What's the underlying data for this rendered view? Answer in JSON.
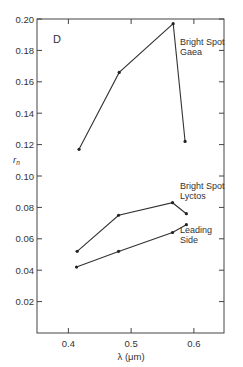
{
  "chart_data": {
    "type": "line",
    "title": "",
    "panel_label": "D",
    "xlabel": "λ (μm)",
    "ylabel": "r_n",
    "xlim": [
      0.35,
      0.648
    ],
    "ylim": [
      0.0,
      0.2
    ],
    "x_ticks": [
      0.4,
      0.5,
      0.6
    ],
    "x_tick_labels": [
      "0.4",
      "0.5",
      "0.6"
    ],
    "y_ticks": [
      0.02,
      0.04,
      0.06,
      0.08,
      0.1,
      0.12,
      0.14,
      0.16,
      0.18,
      0.2
    ],
    "y_tick_labels": [
      "0.02",
      "0.04",
      "0.06",
      "0.08",
      "0.10",
      "0.12",
      "0.14",
      "0.16",
      "0.18",
      "0.20"
    ],
    "grid": false,
    "legend": "none (inline annotations)",
    "series": [
      {
        "name": "Bright Spot Gaea",
        "label_lines": [
          "Bright Spot",
          "Gaea"
        ],
        "x": [
          0.417,
          0.481,
          0.567,
          0.586
        ],
        "values": [
          0.117,
          0.166,
          0.197,
          0.122
        ]
      },
      {
        "name": "Bright Spot Lyctos",
        "label_lines": [
          "Bright Spot",
          "Lyctos"
        ],
        "x": [
          0.414,
          0.48,
          0.566,
          0.588
        ],
        "values": [
          0.052,
          0.075,
          0.083,
          0.076
        ]
      },
      {
        "name": "Leading Side",
        "label_lines": [
          "Leading",
          "Side"
        ],
        "x": [
          0.413,
          0.48,
          0.566,
          0.588
        ],
        "values": [
          0.042,
          0.052,
          0.064,
          0.069
        ]
      }
    ]
  }
}
